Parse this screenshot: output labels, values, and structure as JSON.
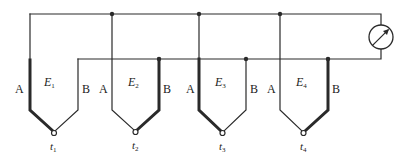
{
  "diagram": {
    "colors": {
      "wire": "#2a2a2a",
      "background": "#ffffff"
    },
    "wire_labels": {
      "a": "A",
      "b": "B"
    },
    "thermocouples": [
      {
        "emf": "E",
        "emf_sub": "1",
        "temp": "t",
        "temp_sub": "1"
      },
      {
        "emf": "E",
        "emf_sub": "2",
        "temp": "t",
        "temp_sub": "2"
      },
      {
        "emf": "E",
        "emf_sub": "3",
        "temp": "t",
        "temp_sub": "3"
      },
      {
        "emf": "E",
        "emf_sub": "4",
        "temp": "t",
        "temp_sub": "4"
      }
    ],
    "meter": {
      "type": "galvanometer-icon"
    }
  }
}
